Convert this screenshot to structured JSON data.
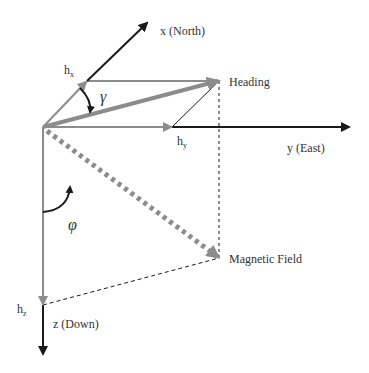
{
  "diagram": {
    "type": "3d-vector-decomposition",
    "title": "",
    "colors": {
      "axis": "#1a1a1a",
      "component": "#8c8c8c",
      "heading_vector": "#8c8c8c",
      "magnetic_vector": "#8c8c8c",
      "guide": "#1a1a1a",
      "background": "#ffffff"
    },
    "axes": {
      "x": {
        "label": "x (North)"
      },
      "y": {
        "label": "y (East)"
      },
      "z": {
        "label": "z (Down)"
      }
    },
    "components": {
      "hx": {
        "label": "h",
        "subscript": "x"
      },
      "hy": {
        "label": "h",
        "subscript": "y"
      },
      "hz": {
        "label": "h",
        "subscript": "z"
      }
    },
    "vectors": {
      "heading": {
        "label": "Heading"
      },
      "magnetic_field": {
        "label": "Magnetic Field"
      }
    },
    "angles": {
      "gamma": {
        "symbol": "γ"
      },
      "phi": {
        "symbol": "φ"
      }
    }
  }
}
